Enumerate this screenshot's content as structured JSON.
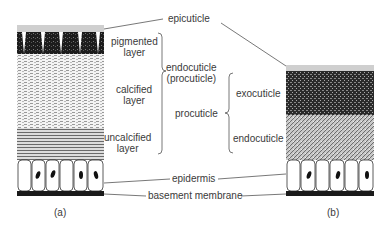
{
  "labels": {
    "epicuticle": "epicuticle",
    "pigmented_1": "pigmented",
    "pigmented_2": "layer",
    "calcified_1": "calcified",
    "calcified_2": "layer",
    "uncalcified_1": "uncalcified",
    "uncalcified_2": "layer",
    "endocuticle_1": "endocuticle",
    "endocuticle_2": "(procuticle)",
    "procuticle": "procuticle",
    "exocuticle": "exocuticle",
    "endocuticle_b": "endocuticle",
    "epidermis": "epidermis",
    "basement_membrane": "basement membrane",
    "caption_a": "(a)",
    "caption_b": "(b)"
  },
  "colors": {
    "line": "#555555",
    "ink": "#1a1a1a"
  }
}
